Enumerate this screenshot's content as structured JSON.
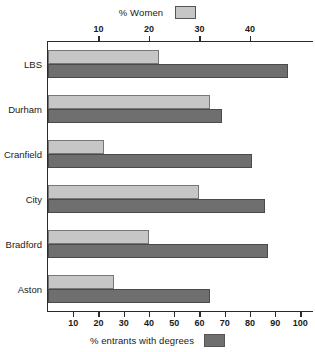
{
  "chart_data": {
    "type": "bar",
    "orientation": "horizontal",
    "title": "",
    "categories": [
      "LBS",
      "Durham",
      "Cranfield",
      "City",
      "Bradford",
      "Aston"
    ],
    "series": [
      {
        "name": "% Women",
        "axis": "top",
        "color": "#c6c6c6",
        "values": [
          22,
          32,
          11,
          30,
          20,
          13
        ]
      },
      {
        "name": "% entrants with degrees",
        "axis": "bottom",
        "color": "#6f6f6f",
        "values": [
          95,
          69,
          81,
          86,
          87,
          64
        ]
      }
    ],
    "top_axis": {
      "label": "% Women",
      "ticks": [
        10,
        20,
        30,
        40
      ],
      "ticklabels": [
        "10",
        "20",
        "30",
        "40"
      ],
      "min": 0,
      "max": 52.5
    },
    "bottom_axis": {
      "label": "% entrants with degrees",
      "ticks": [
        10,
        20,
        30,
        40,
        50,
        60,
        70,
        80,
        90,
        100
      ],
      "ticklabels": [
        "10",
        "20",
        "30",
        "40",
        "50",
        "60",
        "70",
        "80",
        "90",
        "100"
      ],
      "min": 0,
      "max": 105
    },
    "ylabel": "",
    "grid": false,
    "legend_position": "top-and-bottom-center"
  },
  "legend": {
    "top": {
      "label": "% Women",
      "swatch": "light-gray-swatch"
    },
    "bottom": {
      "label": "% entrants with degrees",
      "swatch": "dark-gray-swatch"
    }
  },
  "colors": {
    "women_bar": "#c6c6c6",
    "degrees_bar": "#6f6f6f",
    "axis": "#2b2b2b",
    "background": "#ffffff"
  }
}
